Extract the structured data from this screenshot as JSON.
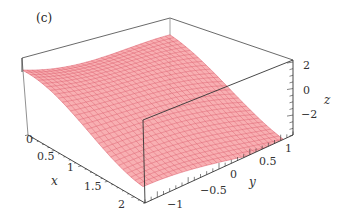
{
  "chart_data": {
    "type": "surface3d",
    "panel_label": "(c)",
    "title": "",
    "xlabel": "x",
    "ylabel": "y",
    "zlabel": "z",
    "x_ticks": [
      "0",
      "0.5",
      "1",
      "1.5",
      "2"
    ],
    "y_ticks": [
      "-1",
      "-0.5",
      "0",
      "0.5",
      "1"
    ],
    "z_ticks": [
      "2",
      "0",
      "-2"
    ],
    "xlim": [
      0,
      2.2
    ],
    "ylim": [
      -1.2,
      1.2
    ],
    "zlim": [
      -3,
      2.5
    ],
    "grid": false,
    "box": true,
    "legend": null,
    "surface_color": "#f08a8a",
    "mesh_color": "#d84a5a"
  },
  "labels": {
    "panel": "(c)",
    "x_axis": "x",
    "y_axis": "y",
    "z_axis": "z",
    "x_ticks": [
      "0",
      "0.5",
      "1",
      "1.5",
      "2"
    ],
    "y_ticks": [
      "−1",
      "−0.5",
      "0",
      "0.5",
      "1"
    ],
    "z_ticks": [
      "2",
      "0",
      "−2"
    ]
  }
}
